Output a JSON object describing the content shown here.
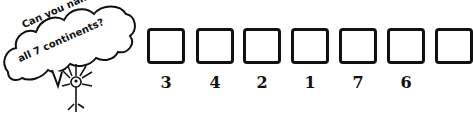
{
  "prompt": {
    "line1": "Can you name",
    "line2": "all 7 continents?"
  },
  "boxes": [
    {
      "number": "3"
    },
    {
      "number": "4"
    },
    {
      "number": "2"
    },
    {
      "number": "1"
    },
    {
      "number": "7"
    },
    {
      "number": "6"
    },
    {
      "number": ""
    }
  ]
}
